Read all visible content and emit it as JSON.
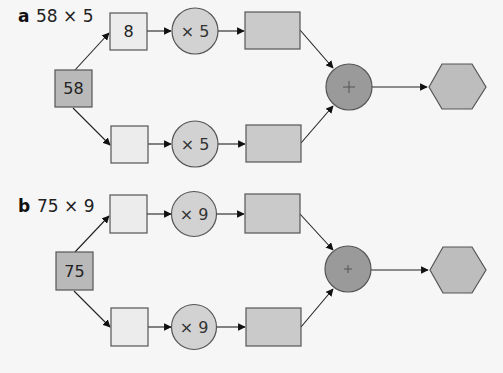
{
  "colors": {
    "background": "#f6f6f6",
    "start_box": "#b9b9b9",
    "empty_box": "#ececec",
    "multiply_circle": "#d2d2d2",
    "product_rect": "#cacaca",
    "add_circle": "#9a9a9a",
    "result_hexagon": "#bdbdbd"
  },
  "diagrams": [
    {
      "letter": "a",
      "expression": "58 × 5",
      "start_value": "58",
      "top": {
        "part": "8",
        "operator": "× 5",
        "product": ""
      },
      "bottom": {
        "part": "",
        "operator": "× 5",
        "product": ""
      },
      "combine_operator": "+",
      "result": ""
    },
    {
      "letter": "b",
      "expression": "75 × 9",
      "start_value": "75",
      "top": {
        "part": "",
        "operator": "× 9",
        "product": ""
      },
      "bottom": {
        "part": "",
        "operator": "× 9",
        "product": ""
      },
      "combine_operator": "+",
      "result": ""
    }
  ]
}
